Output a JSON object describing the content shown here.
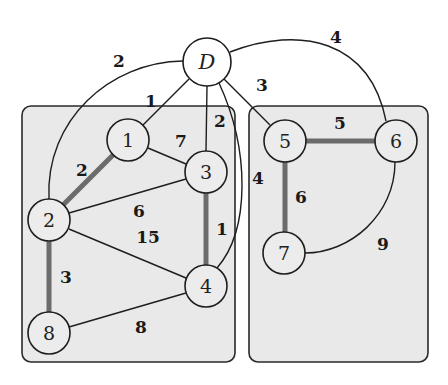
{
  "diagram": {
    "type": "weighted-graph",
    "colors": {
      "box_fill": "#e9e9e9",
      "thick_edge": "#6b6b6b",
      "edge": "#1e1e1e"
    },
    "nodes": [
      {
        "id": "D",
        "label": "D",
        "x": 207,
        "y": 62
      },
      {
        "id": "1",
        "label": "1",
        "x": 128,
        "y": 140
      },
      {
        "id": "2",
        "label": "2",
        "x": 49,
        "y": 220
      },
      {
        "id": "3",
        "label": "3",
        "x": 206,
        "y": 172
      },
      {
        "id": "4",
        "label": "4",
        "x": 206,
        "y": 286
      },
      {
        "id": "5",
        "label": "5",
        "x": 285,
        "y": 141
      },
      {
        "id": "6",
        "label": "6",
        "x": 396,
        "y": 141
      },
      {
        "id": "7",
        "label": "7",
        "x": 284,
        "y": 253
      },
      {
        "id": "8",
        "label": "8",
        "x": 49,
        "y": 333
      }
    ],
    "edges": [
      {
        "from": "D",
        "to": "2",
        "weight": "2",
        "highlighted": false
      },
      {
        "from": "D",
        "to": "1",
        "weight": "1",
        "highlighted": false
      },
      {
        "from": "D",
        "to": "3",
        "weight": "2",
        "highlighted": false
      },
      {
        "from": "D",
        "to": "4",
        "weight": "4",
        "highlighted": false
      },
      {
        "from": "D",
        "to": "5",
        "weight": "3",
        "highlighted": false
      },
      {
        "from": "D",
        "to": "6",
        "weight": "4",
        "highlighted": false
      },
      {
        "from": "1",
        "to": "2",
        "weight": "2",
        "highlighted": true
      },
      {
        "from": "1",
        "to": "3",
        "weight": "7",
        "highlighted": false
      },
      {
        "from": "2",
        "to": "3",
        "weight": "6",
        "highlighted": false
      },
      {
        "from": "2",
        "to": "4",
        "weight": "15",
        "highlighted": false
      },
      {
        "from": "2",
        "to": "8",
        "weight": "3",
        "highlighted": true
      },
      {
        "from": "3",
        "to": "4",
        "weight": "1",
        "highlighted": true
      },
      {
        "from": "4",
        "to": "8",
        "weight": "8",
        "highlighted": false
      },
      {
        "from": "5",
        "to": "6",
        "weight": "5",
        "highlighted": true
      },
      {
        "from": "5",
        "to": "7",
        "weight": "6",
        "highlighted": true
      },
      {
        "from": "6",
        "to": "7",
        "weight": "9",
        "highlighted": false
      }
    ],
    "groups": [
      {
        "name": "left-component",
        "members": [
          "1",
          "2",
          "3",
          "4",
          "8"
        ]
      },
      {
        "name": "right-component",
        "members": [
          "5",
          "6",
          "7"
        ]
      }
    ]
  }
}
